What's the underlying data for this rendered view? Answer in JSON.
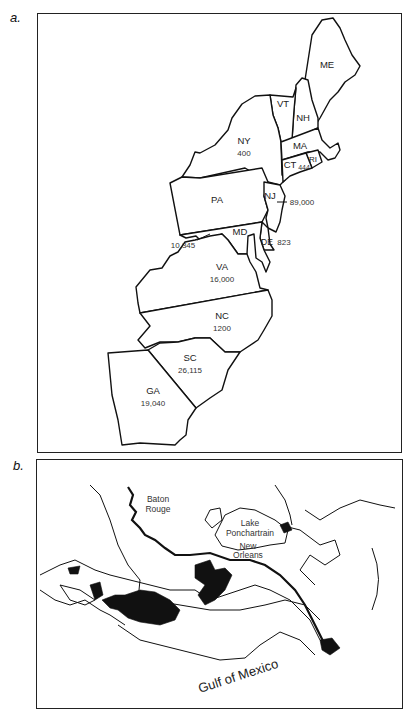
{
  "panel_a": {
    "letter": "a.",
    "states": [
      {
        "abbr": "ME",
        "value": ""
      },
      {
        "abbr": "VT",
        "value": ""
      },
      {
        "abbr": "NH",
        "value": ""
      },
      {
        "abbr": "NY",
        "value": "400"
      },
      {
        "abbr": "MA",
        "value": ""
      },
      {
        "abbr": "CT",
        "value": "444"
      },
      {
        "abbr": "RI",
        "value": ""
      },
      {
        "abbr": "PA",
        "value": ""
      },
      {
        "abbr": "NJ",
        "value": "89,000"
      },
      {
        "abbr": "MD",
        "value": "10,345"
      },
      {
        "abbr": "DE",
        "value": "823"
      },
      {
        "abbr": "VA",
        "value": "16,000"
      },
      {
        "abbr": "NC",
        "value": "1200"
      },
      {
        "abbr": "SC",
        "value": "26,115"
      },
      {
        "abbr": "GA",
        "value": "19,040"
      }
    ]
  },
  "panel_b": {
    "letter": "b.",
    "labels": {
      "baton_rouge_1": "Baton",
      "baton_rouge_2": "Rouge",
      "lake_1": "Lake",
      "lake_2": "Ponchartrain",
      "new_orleans_1": "New",
      "new_orleans_2": "Orleans",
      "gulf": "Gulf of Mexico"
    }
  }
}
